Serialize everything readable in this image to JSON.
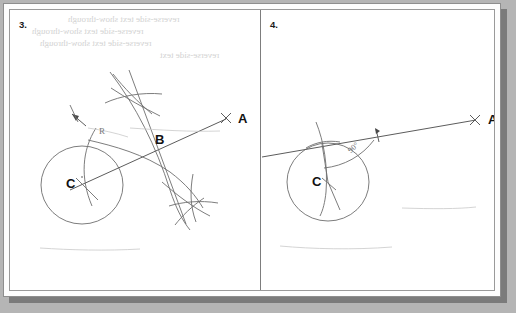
{
  "document": {
    "type": "scanned-worksheet",
    "background_color": "#b5b5b5",
    "paper_color": "#ffffff",
    "ink_color": "#6e6e6e",
    "label_color": "#111111"
  },
  "panels": [
    {
      "number": "3.",
      "name": "panel-three",
      "labels": {
        "point_a": "A",
        "point_b": "B",
        "point_c": "C",
        "radius": "R"
      },
      "figure": {
        "description": "circle with centre C, ray to A through B, perpendicular-bisector construction arcs",
        "circle_center": [
          72,
          175
        ],
        "circle_radius": 40,
        "point_a": [
          218,
          108
        ],
        "point_b": [
          152,
          143
        ],
        "point_c": [
          72,
          175
        ]
      }
    },
    {
      "number": "4.",
      "name": "panel-four",
      "labels": {
        "point_a": "A",
        "point_c": "C",
        "angle": "90°"
      },
      "figure": {
        "description": "circle with centre C, tangent line to A touching circle at top, right-angle marked 90 degrees",
        "circle_center": [
          318,
          172
        ],
        "circle_radius": 40,
        "point_a": [
          468,
          110
        ],
        "point_c": [
          318,
          172
        ]
      }
    }
  ],
  "bleed_through": {
    "line1": "reverse-side text show-through",
    "line2": "reverse-side text show-through",
    "line3": "reverse-side text show-through",
    "line4": "reverse-side text"
  }
}
